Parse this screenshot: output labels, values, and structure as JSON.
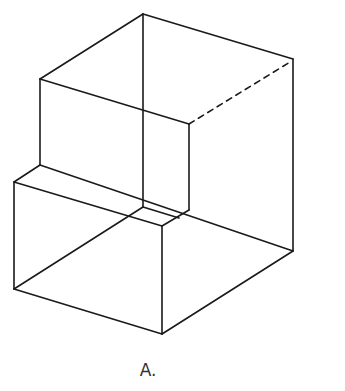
{
  "figure": {
    "caption": "A.",
    "stroke_color": "#1a1a1a",
    "solid_edges": [
      [
        143,
        14,
        293,
        59
      ],
      [
        143,
        14,
        40,
        79
      ],
      [
        143,
        14,
        143,
        207
      ],
      [
        293,
        59,
        293,
        251
      ],
      [
        40,
        79,
        189,
        124
      ],
      [
        40,
        79,
        40,
        165
      ],
      [
        189,
        124,
        189,
        210
      ],
      [
        40,
        165,
        14,
        182
      ],
      [
        40,
        165,
        293,
        251
      ],
      [
        14,
        182,
        162,
        226
      ],
      [
        14,
        182,
        14,
        289
      ],
      [
        162,
        226,
        189,
        210
      ],
      [
        162,
        226,
        162,
        334
      ],
      [
        14,
        289,
        162,
        334
      ],
      [
        162,
        334,
        293,
        251
      ],
      [
        14,
        289,
        143,
        207
      ],
      [
        143,
        207,
        179,
        218
      ]
    ],
    "dashed_edges": [
      [
        189,
        124,
        290,
        62
      ]
    ]
  }
}
